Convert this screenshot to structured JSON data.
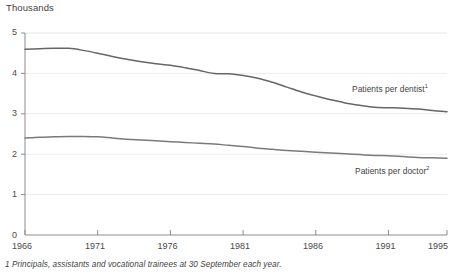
{
  "chart_data": {
    "type": "line",
    "title": "",
    "unit_caption": "Thousands",
    "xlabel": "",
    "ylabel": "Thousands",
    "grid": true,
    "legend_position": "inline-right",
    "xlim": [
      1966,
      1995
    ],
    "ylim": [
      0,
      5
    ],
    "ytick_labels": [
      "5",
      "4",
      "3",
      "2",
      "1",
      "0"
    ],
    "ytick_values": [
      5,
      4,
      3,
      2,
      1,
      0
    ],
    "xtick_labels": [
      "1966",
      "1971",
      "1976",
      "1981",
      "1986",
      "1991",
      "1995"
    ],
    "xtick_values": [
      1966,
      1971,
      1976,
      1981,
      1986,
      1991,
      1995
    ],
    "x": [
      1966,
      1967,
      1968,
      1969,
      1970,
      1971,
      1972,
      1973,
      1974,
      1975,
      1976,
      1977,
      1978,
      1979,
      1980,
      1981,
      1982,
      1983,
      1984,
      1985,
      1986,
      1987,
      1988,
      1989,
      1990,
      1991,
      1992,
      1993,
      1994,
      1995
    ],
    "series": [
      {
        "name": "Patients per dentist",
        "footnote_marker": "1",
        "color": "#666666",
        "values": [
          4.6,
          4.61,
          4.62,
          4.62,
          4.57,
          4.5,
          4.42,
          4.35,
          4.29,
          4.24,
          4.2,
          4.14,
          4.07,
          4.0,
          3.99,
          3.95,
          3.88,
          3.78,
          3.66,
          3.54,
          3.44,
          3.35,
          3.27,
          3.21,
          3.16,
          3.15,
          3.14,
          3.12,
          3.08,
          3.05
        ]
      },
      {
        "name": "Patients per doctor",
        "footnote_marker": "2",
        "color": "#7a7a7a",
        "values": [
          2.4,
          2.42,
          2.43,
          2.44,
          2.44,
          2.43,
          2.4,
          2.37,
          2.35,
          2.33,
          2.31,
          2.29,
          2.27,
          2.25,
          2.22,
          2.19,
          2.15,
          2.12,
          2.09,
          2.07,
          2.05,
          2.03,
          2.01,
          1.99,
          1.97,
          1.96,
          1.94,
          1.92,
          1.91,
          1.9
        ]
      }
    ],
    "annotations": [
      {
        "text": "Patients per dentist",
        "marker": "1",
        "x": 1989,
        "y": 3.55
      },
      {
        "text": "Patients per doctor",
        "marker": "2",
        "x": 1989,
        "y": 1.62
      }
    ],
    "footnotes": [
      "1 Principals, assistants and vocational trainees at 30 September each year."
    ]
  }
}
